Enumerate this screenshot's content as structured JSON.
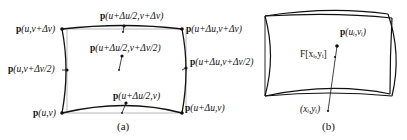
{
  "figure": {
    "panel_a": {
      "caption": "(a)",
      "labels": {
        "top_left": {
          "p": "p",
          "args": "(u,v+Δv)"
        },
        "top_mid": {
          "p": "p",
          "args": "(u+Δu/2,v+Δv)"
        },
        "top_right": {
          "p": "p",
          "args": "(u+Δu,v+Δv)"
        },
        "center": {
          "p": "p",
          "args": "(u+Δu/2,v+Δv/2)"
        },
        "left_mid": {
          "p": "p",
          "args": "(u,v+Δv/2)"
        },
        "right_mid": {
          "p": "p",
          "args": "(u+Δu,v+Δv/2)"
        },
        "bottom_left": {
          "p": "p",
          "args": "(u,v)"
        },
        "bottom_mid": {
          "p": "p",
          "args": "(u+Δu/2,v)"
        },
        "bottom_right": {
          "p": "p",
          "args": "(u+Δu,v)"
        }
      }
    },
    "panel_b": {
      "caption": "(b)",
      "labels": {
        "surface_point": {
          "p": "p",
          "args": "(u_i,v_i)",
          "display": "(uᵢ,vᵢ)"
        },
        "mapped_point": {
          "text": "F[xᵢ,yᵢ]"
        },
        "image_point": {
          "text": "(xᵢ,yᵢ)"
        }
      }
    },
    "colors": {
      "curve": "#111111",
      "reference": "#9a9a9a",
      "text": "#111111"
    }
  }
}
